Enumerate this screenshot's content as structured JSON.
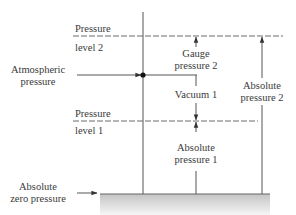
{
  "diagram": {
    "labels": {
      "pressure_level_2_top": "Pressure",
      "pressure_level_2_bottom": "level 2",
      "pressure_level_1_top": "Pressure",
      "pressure_level_1_bottom": "level 1",
      "atmospheric_line1": "Atmospheric",
      "atmospheric_line2": "pressure",
      "absolute_zero_line1": "Absolute",
      "absolute_zero_line2": "zero pressure",
      "gauge_line1": "Gauge",
      "gauge_line2": "pressure 2",
      "vacuum": "Vacuum 1",
      "abs1_line1": "Absolute",
      "abs1_line2": "pressure 1",
      "abs2_line1": "Absolute",
      "abs2_line2": "pressure 2"
    },
    "nodes": [
      {
        "id": "pressure-level-2",
        "label": "Pressure level 2",
        "type": "dashed-level"
      },
      {
        "id": "atmospheric-pressure",
        "label": "Atmospheric pressure",
        "type": "reference-level"
      },
      {
        "id": "pressure-level-1",
        "label": "Pressure level 1",
        "type": "dashed-level"
      },
      {
        "id": "absolute-zero-pressure",
        "label": "Absolute zero pressure",
        "type": "ground"
      }
    ],
    "edges": [
      {
        "from": "atmospheric-pressure",
        "to": "pressure-level-2",
        "label": "Gauge pressure 2"
      },
      {
        "from": "atmospheric-pressure",
        "to": "pressure-level-1",
        "label": "Vacuum 1"
      },
      {
        "from": "absolute-zero-pressure",
        "to": "pressure-level-1",
        "label": "Absolute pressure 1"
      },
      {
        "from": "absolute-zero-pressure",
        "to": "pressure-level-2",
        "label": "Absolute pressure 2"
      }
    ],
    "colors": {
      "line": "#555555",
      "text": "#3a3a3a",
      "ground_top": "#c8c8c8",
      "ground_bottom": "#f4f4f4"
    }
  }
}
